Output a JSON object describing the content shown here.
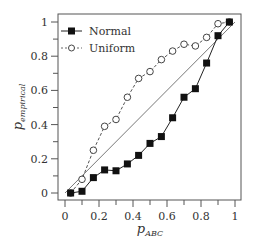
{
  "chart_data": {
    "type": "line",
    "title": "",
    "xlabel": "p_ABC",
    "ylabel": "p_empirical",
    "xlabel_main": "p",
    "xlabel_sub": "ABC",
    "ylabel_main": "p",
    "ylabel_sub": "empirical",
    "xlim": [
      0,
      1
    ],
    "ylim": [
      0,
      1
    ],
    "xticks": [
      "0",
      "0.2",
      "0.4",
      "0.6",
      "0.8",
      "1"
    ],
    "yticks": [
      "0",
      "0.2",
      "0.4",
      "0.6",
      "0.8",
      "1"
    ],
    "grid": false,
    "legend_position": "upper left",
    "reference_line": {
      "from": [
        0,
        0
      ],
      "to": [
        1,
        1
      ],
      "style": "solid thin"
    },
    "x": [
      0.033,
      0.1,
      0.167,
      0.233,
      0.3,
      0.367,
      0.433,
      0.5,
      0.567,
      0.633,
      0.7,
      0.767,
      0.833,
      0.9,
      0.967
    ],
    "series": [
      {
        "name": "Normal",
        "marker": "filled-square",
        "line": "solid",
        "values": [
          0.0,
          0.01,
          0.09,
          0.135,
          0.13,
          0.17,
          0.22,
          0.29,
          0.33,
          0.44,
          0.56,
          0.61,
          0.76,
          0.92,
          1.0
        ]
      },
      {
        "name": "Uniform",
        "marker": "open-circle",
        "line": "dashed",
        "values": [
          0.0,
          0.08,
          0.25,
          0.39,
          0.43,
          0.56,
          0.67,
          0.71,
          0.78,
          0.83,
          0.87,
          0.86,
          0.91,
          0.99,
          1.0
        ]
      }
    ]
  },
  "legend": {
    "normal": "Normal",
    "uniform": "Uniform"
  }
}
